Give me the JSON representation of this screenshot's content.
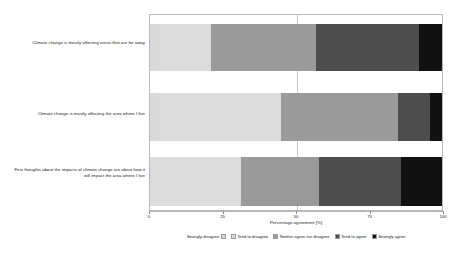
{
  "chart_data": {
    "type": "bar",
    "orientation": "horizontal",
    "stacked": true,
    "title": "",
    "subtitle": "",
    "xlabel": "Percentage agreement [%]",
    "ylabel": "",
    "xlim": [
      0,
      100
    ],
    "xticks": [
      0,
      25,
      50,
      75,
      100
    ],
    "xticklabels": [
      "0",
      "25",
      "50",
      "75",
      "100"
    ],
    "grid": true,
    "gridlines_x": [
      50
    ],
    "legend_position": "bottom",
    "categories": [
      "Climate change is mostly affecting areas that are far away",
      "Climate change is mostly affecting the area where I live",
      "First thoughts about the impacts of climate change are about how it will impact the area where I live"
    ],
    "series": [
      {
        "name": "Strongly disagree",
        "color": "#d9d9d9",
        "values": [
          3,
          3,
          0
        ]
      },
      {
        "name": "Tend to disagree",
        "color": "#dcdcdc",
        "values": [
          18,
          42,
          31
        ]
      },
      {
        "name": "Neither agree nor disagree",
        "color": "#9a9a9a",
        "values": [
          36,
          40,
          27
        ]
      },
      {
        "name": "Tend to agree",
        "color": "#4d4d4d",
        "values": [
          35,
          11,
          28
        ]
      },
      {
        "name": "Strongly agree",
        "color": "#111111",
        "values": [
          8,
          4,
          14
        ]
      }
    ],
    "colors": {
      "strongly_disagree": "#d9d9d9",
      "tend_to_disagree": "#dcdcdc",
      "neither": "#9a9a9a",
      "tend_to_agree": "#4d4d4d",
      "strongly_agree": "#111111",
      "frame": "#b8b8b8",
      "gridline": "#c9c9c9",
      "text": "#1a1a1a",
      "background": "#ffffff"
    }
  },
  "legend": {
    "items": [
      {
        "label": "Strongly disagree"
      },
      {
        "label": "Tend to disagree"
      },
      {
        "label": "Neither agree nor disagree"
      },
      {
        "label": "Tend to agree"
      },
      {
        "label": "Strongly agree"
      }
    ]
  },
  "axis": {
    "x_title": "Percentage agreement [%]",
    "x_tick_labels": [
      "0",
      "25",
      "50",
      "75",
      "100"
    ]
  },
  "category_labels": [
    "Climate change is mostly affecting areas that are far away",
    "Climate change is mostly affecting the area where I live",
    "First thoughts about the impacts of climate change are about how it will impact the area where I live"
  ]
}
